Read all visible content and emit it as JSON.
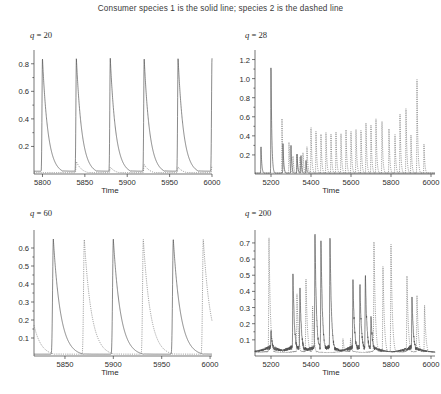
{
  "figure": {
    "title": "Consumer species 1 is the solid line; species 2 is the dashed line",
    "width": 441,
    "height": 394,
    "background": "#ffffff",
    "solid_color": "#4a4a4a",
    "dashed_color": "#6a6a6a"
  },
  "chart_data": [
    {
      "type": "line",
      "id": "panel-q20",
      "title": "q = 20",
      "param_symbol": "q",
      "param_value": 20,
      "xlabel": "Time",
      "ylabel": "",
      "xlim": [
        5790,
        6000
      ],
      "ylim": [
        0,
        0.9
      ],
      "xticks": [
        5800,
        5850,
        5900,
        5950,
        6000
      ],
      "xticklabels": [
        "5800",
        "5850",
        "5900",
        "5950",
        "6000"
      ],
      "yticks": [
        0.2,
        0.4,
        0.6,
        0.8
      ],
      "yticklabels": [
        "0.2",
        "0.4",
        "0.6",
        "0.8"
      ],
      "grid": false,
      "legend": "none",
      "series": [
        {
          "name": "Consumer species 1",
          "style": "solid",
          "description": "Large regular relaxation-oscillation spikes reaching ~0.84, period ~40 time units",
          "peak_times": [
            5800,
            5840,
            5880,
            5920,
            5960,
            6000
          ],
          "peak_values": [
            0.84,
            0.84,
            0.84,
            0.84,
            0.84,
            0.84
          ],
          "baseline": 0.02
        },
        {
          "name": "Consumer species 2",
          "style": "dashed",
          "description": "Small subordinate bumps following each species-1 crash, amplitude ~0.09",
          "peak_times": [
            5840,
            5880,
            5920,
            5960,
            6000
          ],
          "peak_values": [
            0.09,
            0.05,
            0.07,
            0.05,
            0.06
          ],
          "baseline": 0.01
        }
      ]
    },
    {
      "type": "line",
      "id": "panel-q28",
      "title": "q = 28",
      "param_symbol": "q",
      "param_value": 28,
      "xlabel": "Time",
      "ylabel": "",
      "xlim": [
        5120,
        6020
      ],
      "ylim": [
        0,
        1.3
      ],
      "xticks": [
        5200,
        5400,
        5600,
        5800,
        6000
      ],
      "xticklabels": [
        "5200",
        "5400",
        "5600",
        "5800",
        "6000"
      ],
      "yticks": [
        0.2,
        0.4,
        0.6,
        0.8,
        1.0,
        1.2
      ],
      "yticklabels": [
        "0.2",
        "0.4",
        "0.6",
        "0.8",
        "1.0",
        "1.2"
      ],
      "grid": false,
      "legend": "none",
      "series": [
        {
          "name": "Consumer species 1",
          "style": "solid",
          "description": "Two tall early spikes (~1.17 near t=5200) then rapid decay to near zero; transient chaotic bursts before extinction",
          "peak_times": [
            5150,
            5200,
            5260,
            5300,
            5330,
            5350,
            5375
          ],
          "peak_values": [
            0.3,
            1.17,
            0.33,
            0.3,
            0.22,
            0.2,
            0.15
          ],
          "baseline": 0.01
        },
        {
          "name": "Consumer species 2",
          "style": "dashed",
          "description": "Irregular chaotic oscillations that grow in amplitude over time, reaching ~1.0 near t=5930",
          "peak_times": [
            5255,
            5290,
            5310,
            5330,
            5345,
            5360,
            5380,
            5400,
            5425,
            5450,
            5475,
            5500,
            5525,
            5550,
            5575,
            5600,
            5625,
            5650,
            5675,
            5700,
            5725,
            5755,
            5790,
            5820,
            5845,
            5875,
            5900,
            5930,
            5965
          ],
          "peak_values": [
            0.58,
            0.35,
            0.2,
            0.22,
            0.18,
            0.23,
            0.3,
            0.52,
            0.47,
            0.43,
            0.44,
            0.42,
            0.44,
            0.43,
            0.48,
            0.47,
            0.5,
            0.48,
            0.55,
            0.52,
            0.58,
            0.57,
            0.48,
            0.42,
            0.65,
            0.72,
            0.42,
            0.99,
            0.33
          ],
          "baseline": 0.01
        }
      ]
    },
    {
      "type": "line",
      "id": "panel-q60",
      "title": "q = 60",
      "param_symbol": "q",
      "param_value": 60,
      "xlabel": "Time",
      "ylabel": "",
      "xlim": [
        5818,
        6002
      ],
      "ylim": [
        0,
        0.7
      ],
      "xticks": [
        5850,
        5900,
        5950,
        6000
      ],
      "xticklabels": [
        "5850",
        "5900",
        "5950",
        "6000"
      ],
      "yticks": [
        0.1,
        0.2,
        0.3,
        0.4,
        0.5,
        0.6
      ],
      "yticklabels": [
        "0.1",
        "0.2",
        "0.3",
        "0.4",
        "0.5",
        "0.6"
      ],
      "grid": false,
      "legend": "none",
      "series": [
        {
          "name": "Consumer species 1",
          "style": "solid",
          "description": "Regular sharp spikes to ~0.65 with slow decay tails, period ~62 time units, alternating with species 2",
          "peak_times": [
            5838,
            5900,
            5962
          ],
          "peak_values": [
            0.65,
            0.65,
            0.65
          ],
          "baseline": 0.01
        },
        {
          "name": "Consumer species 2",
          "style": "dashed",
          "description": "Identical-shaped spikes to ~0.65, phase-shifted by half a period relative to species 1",
          "peak_times": [
            5808,
            5870,
            5931,
            5993
          ],
          "peak_values": [
            0.65,
            0.65,
            0.65,
            0.65
          ],
          "baseline": 0.01
        }
      ]
    },
    {
      "type": "line",
      "id": "panel-q200",
      "title": "q = 200",
      "param_symbol": "q",
      "param_value": 200,
      "xlabel": "Time",
      "ylabel": "",
      "xlim": [
        5120,
        6020
      ],
      "ylim": [
        0,
        0.78
      ],
      "xticks": [
        5200,
        5400,
        5600,
        5800,
        6000
      ],
      "xticklabels": [
        "5200",
        "5400",
        "5600",
        "5800",
        "6000"
      ],
      "yticks": [
        0.1,
        0.2,
        0.3,
        0.4,
        0.5,
        0.6,
        0.7
      ],
      "yticklabels": [
        "0.1",
        "0.2",
        "0.3",
        "0.4",
        "0.5",
        "0.6",
        "0.7"
      ],
      "grid": false,
      "legend": "none",
      "series": [
        {
          "name": "Consumer species 1",
          "style": "solid",
          "description": "Irregular chaotic bursts with slow ramp-up plateaus near 0.1-0.3 punctuated by tall spikes up to ~0.73",
          "peak_times": [
            5200,
            5310,
            5345,
            5420,
            5450,
            5495,
            5610,
            5645,
            5672,
            5700,
            5905
          ],
          "peak_values": [
            0.12,
            0.47,
            0.38,
            0.73,
            0.68,
            0.71,
            0.43,
            0.4,
            0.47,
            0.21,
            0.32
          ],
          "baseline": 0.02
        },
        {
          "name": "Consumer species 2",
          "style": "dashed",
          "description": "Chaotic alternating spikes up to ~0.73, out of phase with species 1, with long quiescent gaps",
          "peak_times": [
            5190,
            5330,
            5375,
            5408,
            5560,
            5598,
            5715,
            5760,
            5800,
            5880,
            5930,
            5968
          ],
          "peak_values": [
            0.73,
            0.39,
            0.48,
            0.3,
            0.1,
            0.1,
            0.72,
            0.56,
            0.7,
            0.49,
            0.37,
            0.31
          ],
          "baseline": 0.02
        }
      ]
    }
  ]
}
